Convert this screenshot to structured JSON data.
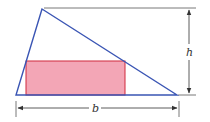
{
  "diagram": {
    "type": "geometry",
    "labels": {
      "base": "b",
      "height": "h"
    },
    "colors": {
      "triangle_stroke": "#3a55b4",
      "rectangle_fill": "#f3a6b6",
      "rectangle_stroke": "#d0283c",
      "dimension_lines": "#444444",
      "background": "#ffffff"
    },
    "triangle": {
      "apex": [
        42,
        9
      ],
      "bottom_left": [
        16,
        95
      ],
      "bottom_right": [
        177,
        95
      ]
    },
    "rectangle": {
      "x": 26,
      "y": 61,
      "width": 99,
      "height": 34
    }
  }
}
